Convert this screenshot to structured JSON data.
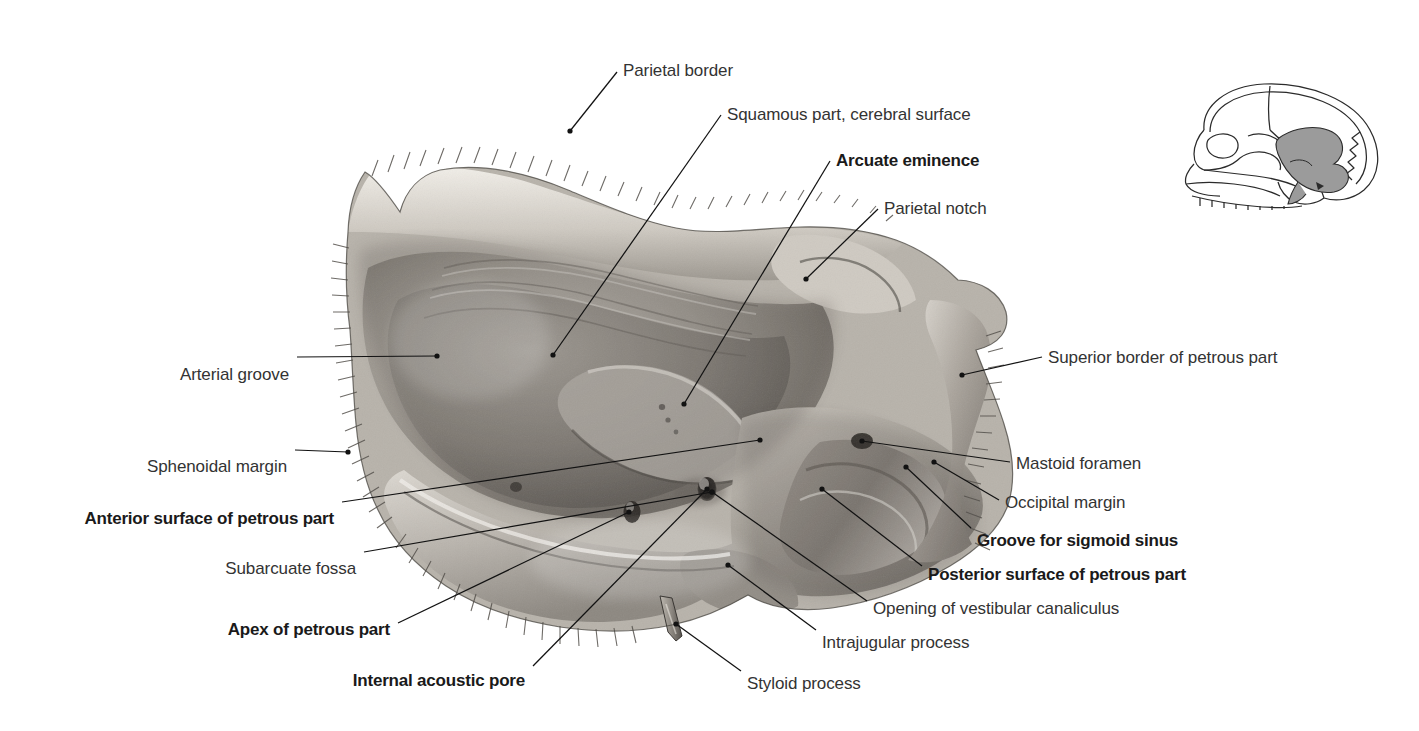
{
  "figure": {
    "background_color": "#ffffff",
    "label_color": "#333333",
    "bold_label_color": "#1a1a1a",
    "leader_color": "#121212",
    "bone_light": "#e9e6e0",
    "bone_mid": "#b6b1aa",
    "bone_dark": "#6e6a64",
    "bone_shadow": "#3c3935"
  },
  "labels": [
    {
      "id": "parietal-border",
      "text": "Parietal border",
      "bold": false,
      "align": "left",
      "x": 623,
      "y": 61
    },
    {
      "id": "squamous-part",
      "text": "Squamous part, cerebral surface",
      "bold": false,
      "align": "left",
      "x": 727,
      "y": 105
    },
    {
      "id": "arcuate-eminence",
      "text": "Arcuate eminence",
      "bold": true,
      "align": "left",
      "x": 836,
      "y": 151
    },
    {
      "id": "parietal-notch",
      "text": "Parietal notch",
      "bold": false,
      "align": "left",
      "x": 884,
      "y": 199
    },
    {
      "id": "superior-border-petrous",
      "text": "Superior border of petrous part",
      "bold": false,
      "align": "left",
      "x": 1048,
      "y": 348
    },
    {
      "id": "arterial-groove",
      "text": "Arterial groove",
      "bold": false,
      "align": "right",
      "x": 289,
      "y": 365
    },
    {
      "id": "sphenoidal-margin",
      "text": "Sphenoidal margin",
      "bold": false,
      "align": "right",
      "x": 287,
      "y": 457
    },
    {
      "id": "mastoid-foramen",
      "text": "Mastoid foramen",
      "bold": false,
      "align": "left",
      "x": 1016,
      "y": 454
    },
    {
      "id": "occipital-margin",
      "text": "Occipital margin",
      "bold": false,
      "align": "left",
      "x": 1005,
      "y": 493
    },
    {
      "id": "anterior-surface-petrous",
      "text": "Anterior surface of petrous part",
      "bold": true,
      "align": "right",
      "x": 334,
      "y": 509
    },
    {
      "id": "groove-sigmoid-sinus",
      "text": "Groove for sigmoid sinus",
      "bold": true,
      "align": "left",
      "x": 977,
      "y": 531
    },
    {
      "id": "subarcuate-fossa",
      "text": "Subarcuate fossa",
      "bold": false,
      "align": "right",
      "x": 356,
      "y": 559
    },
    {
      "id": "posterior-surface-petrous",
      "text": "Posterior surface of petrous part",
      "bold": true,
      "align": "left",
      "x": 928,
      "y": 565
    },
    {
      "id": "opening-vestibular-canaliculus",
      "text": "Opening of vestibular canaliculus",
      "bold": false,
      "align": "left",
      "x": 873,
      "y": 599
    },
    {
      "id": "apex-petrous-part",
      "text": "Apex of petrous part",
      "bold": true,
      "align": "right",
      "x": 390,
      "y": 620
    },
    {
      "id": "intrajugular-process",
      "text": "Intrajugular process",
      "bold": false,
      "align": "left",
      "x": 822,
      "y": 633
    },
    {
      "id": "internal-acoustic-pore",
      "text": "Internal acoustic pore",
      "bold": true,
      "align": "right",
      "x": 525,
      "y": 671
    },
    {
      "id": "styloid-process",
      "text": "Styloid process",
      "bold": false,
      "align": "left",
      "x": 747,
      "y": 674
    }
  ],
  "leaders": [
    {
      "id": "leader-parietal-border",
      "points": "617,72 570,131",
      "dot": "570,131"
    },
    {
      "id": "leader-squamous-part",
      "points": "721,115 553,355",
      "dot": "553,355"
    },
    {
      "id": "leader-arcuate-eminence",
      "points": "830,161 684,404",
      "dot": "684,404"
    },
    {
      "id": "leader-parietal-notch",
      "points": "878,209 806,279",
      "dot": "806,279"
    },
    {
      "id": "leader-superior-border-petrous",
      "points": "1042,357 962,375",
      "dot": "962,375"
    },
    {
      "id": "leader-arterial-groove",
      "points": "297,357 437,356",
      "dot": "437,356"
    },
    {
      "id": "leader-sphenoidal-margin",
      "points": "295,450 348,452",
      "dot": "348,452"
    },
    {
      "id": "leader-mastoid-foramen",
      "points": "1010,462 862,441",
      "dot": "862,441"
    },
    {
      "id": "leader-occipital-margin",
      "points": "999,500 934,462",
      "dot": "934,462"
    },
    {
      "id": "leader-anterior-surface-petrous",
      "points": "342,502 760,440",
      "dot": "760,440"
    },
    {
      "id": "leader-groove-sigmoid-sinus",
      "points": "971,528 906,467",
      "dot": "906,467"
    },
    {
      "id": "leader-subarcuate-fossa",
      "points": "364,552 712,492",
      "dot": "712,492"
    },
    {
      "id": "leader-posterior-surface-petrous",
      "points": "922,566 822,489",
      "dot": "822,489"
    },
    {
      "id": "leader-opening-vestibular-canaliculus",
      "points": "867,601 712,492",
      "dot": "712,492"
    },
    {
      "id": "leader-apex-petrous-part",
      "points": "398,623 629,512",
      "dot": "629,512"
    },
    {
      "id": "leader-intrajugular-process",
      "points": "816,630 728,565",
      "dot": "728,565"
    },
    {
      "id": "leader-internal-acoustic-pore",
      "points": "533,666 707,489",
      "dot": "707,489"
    },
    {
      "id": "leader-styloid-process",
      "points": "741,671 676,624",
      "dot": "676,624"
    }
  ],
  "orientation_diagram": {
    "id": "orientation-skull-thumbnail",
    "description": "Lateral skull outline with temporal bone shaded",
    "highlight_color": "#9b9b9b",
    "outline_color": "#2b2b2b"
  }
}
